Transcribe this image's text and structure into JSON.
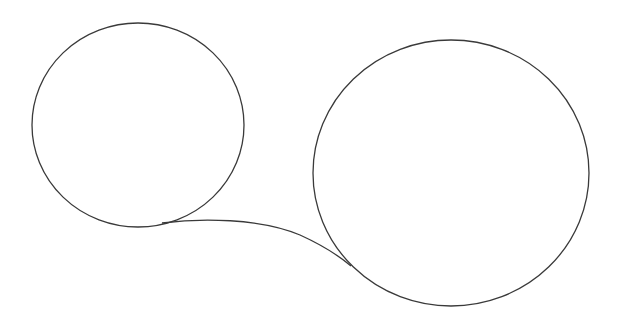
{
  "diagram": {
    "background": "#ffffff",
    "stroke_color": "#3a3a3a",
    "shapes": [
      {
        "id": "small-circle",
        "type": "ellipse",
        "cx": 138,
        "cy": 125,
        "rx": 106,
        "ry": 102
      },
      {
        "id": "large-circle",
        "type": "ellipse",
        "cx": 451,
        "cy": 173,
        "rx": 138,
        "ry": 133
      },
      {
        "id": "connector-curve",
        "type": "path",
        "d": "M 162 223 C 200 218, 260 218, 300 235 C 322 245, 338 255, 351 266"
      }
    ]
  }
}
